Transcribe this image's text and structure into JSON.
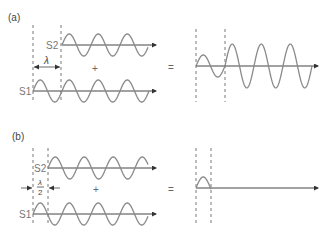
{
  "diagram": {
    "colors": {
      "wave": "#8a8a8a",
      "axis": "#444444",
      "dash": "#555555",
      "text": "#444444"
    },
    "operators": {
      "plus": "+",
      "equals": "="
    },
    "panels": [
      {
        "id": "a",
        "label": "(a)",
        "label_pos": [
          8,
          21
        ],
        "offset_label": "λ",
        "offset_type": "full-wavelength",
        "dashes_left": [
          33,
          61
        ],
        "dash_y": [
          25,
          103
        ],
        "dim_arrow_y": 67,
        "plus_pos": [
          92,
          72
        ],
        "equals_pos": [
          168,
          71
        ],
        "sources": [
          {
            "name": "S2",
            "axis_y": 45,
            "x_start": 62,
            "x_end": 148,
            "arrow_x": 156,
            "amplitude": 11,
            "wavelength": 29,
            "label_pos": [
              46,
              49
            ]
          },
          {
            "name": "S1",
            "axis_y": 91,
            "x_start": 33,
            "x_end": 149,
            "arrow_x": 156,
            "amplitude": 11,
            "wavelength": 29,
            "label_pos": [
              19,
              95
            ]
          }
        ],
        "result": {
          "axis_y": 66,
          "x_start": 196,
          "x_end": 312,
          "arrow_x": 318,
          "dashes": [
            196,
            225
          ],
          "segments": [
            {
              "from": 196,
              "to": 225,
              "amplitude": 11
            },
            {
              "from": 225,
              "to": 312,
              "amplitude": 22
            }
          ],
          "wavelength": 29
        }
      },
      {
        "id": "b",
        "label": "(b)",
        "label_pos": [
          12,
          140
        ],
        "offset_label_num": "λ",
        "offset_label_den": "2",
        "offset_type": "half-wavelength",
        "dashes_left": [
          33,
          48
        ],
        "dash_y": [
          148,
          226
        ],
        "dim_arrow_y": 188,
        "plus_pos": [
          93,
          193
        ],
        "equals_pos": [
          168,
          193
        ],
        "sources": [
          {
            "name": "S2",
            "axis_y": 168,
            "x_start": 48,
            "x_end": 148,
            "arrow_x": 156,
            "amplitude": 11,
            "wavelength": 29,
            "label_pos": [
              33,
              172
            ]
          },
          {
            "name": "S1",
            "axis_y": 214,
            "x_start": 33,
            "x_end": 148,
            "arrow_x": 156,
            "amplitude": 11,
            "wavelength": 29,
            "label_pos": [
              19,
              218
            ]
          }
        ],
        "result": {
          "axis_y": 188,
          "x_start": 196,
          "x_end": 316,
          "arrow_x": 318,
          "dashes": [
            196,
            211
          ],
          "segments": [
            {
              "from": 196,
              "to": 211,
              "amplitude": 11
            }
          ],
          "wavelength": 29
        }
      }
    ]
  }
}
